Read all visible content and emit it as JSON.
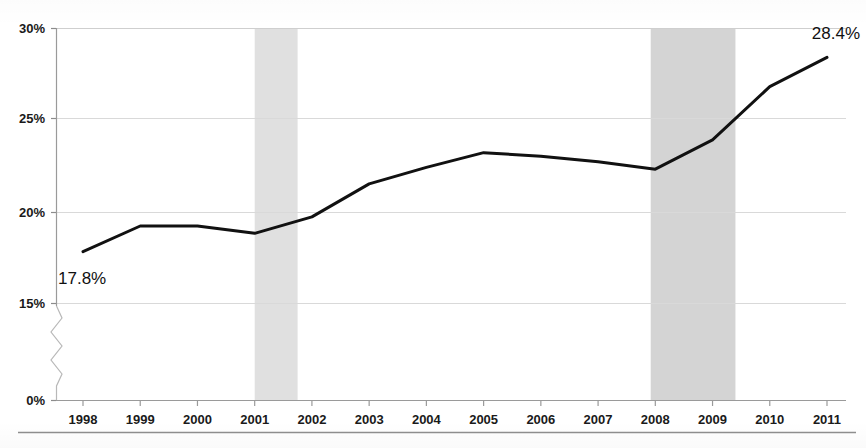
{
  "chart_data": {
    "type": "line",
    "title": "",
    "subtitle": "",
    "xlabel": "",
    "ylabel": "",
    "categories": [
      "1998",
      "1999",
      "2000",
      "2001",
      "2002",
      "2003",
      "2004",
      "2005",
      "2006",
      "2007",
      "2008",
      "2009",
      "2010",
      "2011"
    ],
    "values": [
      17.8,
      19.2,
      19.2,
      18.8,
      19.7,
      21.5,
      22.4,
      23.2,
      23.0,
      22.7,
      22.3,
      23.9,
      26.8,
      28.4
    ],
    "series": [
      {
        "name": "",
        "values": [
          17.8,
          19.2,
          19.2,
          18.8,
          19.7,
          21.5,
          22.4,
          23.2,
          23.0,
          22.7,
          22.3,
          23.9,
          26.8,
          28.4
        ]
      }
    ],
    "ylim": [
      0,
      30
    ],
    "y_axis_broken": true,
    "y_break_between": [
      0,
      15
    ],
    "y_ticks": [
      "0%",
      "15%",
      "20%",
      "25%",
      "30%"
    ],
    "y_tick_values": [
      0,
      15,
      20,
      25,
      30
    ],
    "x_ticks": [
      "1998",
      "1999",
      "2000",
      "2001",
      "2002",
      "2003",
      "2004",
      "2005",
      "2006",
      "2007",
      "2008",
      "2009",
      "2010",
      "2011"
    ],
    "grid": true,
    "grid_axis": "y",
    "legend": "none",
    "data_labels": [
      {
        "category": "1998",
        "text": "17.8%"
      },
      {
        "category": "2011",
        "text": "28.4%"
      }
    ],
    "shaded_bands": [
      {
        "label": "",
        "from": 2001.0,
        "to": 2001.75,
        "color": "#e0e0e0"
      },
      {
        "label": "",
        "from": 2007.92,
        "to": 2009.4,
        "color": "#d4d4d4"
      }
    ],
    "colors": {
      "line": "#111111",
      "grid": "#d9d9d9",
      "axis": "#9a9a9a",
      "band_1": "#e0e0e0",
      "band_2": "#d4d4d4",
      "text": "#1a1a1a",
      "background": "#ffffff"
    },
    "line_width": 3
  },
  "axis": {
    "y_labels": [
      "30%",
      "25%",
      "20%",
      "15%",
      "0%"
    ],
    "x_labels": [
      "1998",
      "1999",
      "2000",
      "2001",
      "2002",
      "2003",
      "2004",
      "2005",
      "2006",
      "2007",
      "2008",
      "2009",
      "2010",
      "2011"
    ]
  },
  "annotations": {
    "start_label": "17.8%",
    "end_label": "28.4%"
  }
}
